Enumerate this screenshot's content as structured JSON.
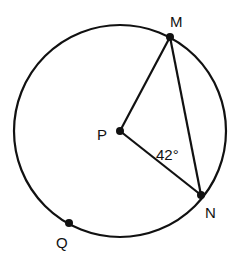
{
  "diagram": {
    "type": "circle-geometry",
    "circle": {
      "center_label": "P"
    },
    "points": [
      {
        "label": "M",
        "on": "circle"
      },
      {
        "label": "N",
        "on": "circle"
      },
      {
        "label": "Q",
        "on": "circle"
      },
      {
        "label": "P",
        "on": "center"
      }
    ],
    "segments": [
      "PM",
      "PN",
      "MN"
    ],
    "angle": {
      "vertex": "N",
      "between": [
        "PN",
        "MN"
      ],
      "label": "42°"
    },
    "labels": {
      "M": "M",
      "N": "N",
      "Q": "Q",
      "P": "P",
      "angle": "42°"
    },
    "colors": {
      "stroke": "#111111",
      "background": "#ffffff"
    }
  }
}
